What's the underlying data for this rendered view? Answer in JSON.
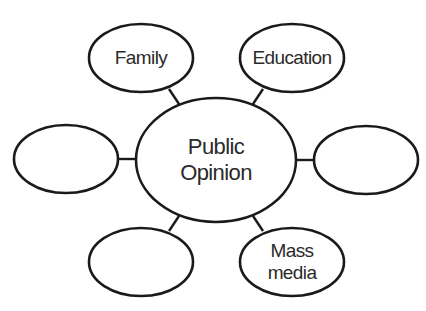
{
  "diagram": {
    "type": "concept-web",
    "center": {
      "id": "public-opinion",
      "lines": [
        "Public",
        "Opinion"
      ],
      "cx": 216,
      "cy": 160,
      "rx": 80,
      "ry": 62
    },
    "nodes": [
      {
        "id": "family",
        "lines": [
          "Family"
        ],
        "cx": 141,
        "cy": 58,
        "rx": 52,
        "ry": 34,
        "connector": {
          "x1": 169,
          "y1": 89,
          "x2": 179,
          "y2": 104
        }
      },
      {
        "id": "education",
        "lines": [
          "Education"
        ],
        "cx": 292,
        "cy": 58,
        "rx": 52,
        "ry": 34,
        "connector": {
          "x1": 263,
          "y1": 89,
          "x2": 253,
          "y2": 104
        }
      },
      {
        "id": "left-blank",
        "lines": [],
        "cx": 66,
        "cy": 159,
        "rx": 52,
        "ry": 34,
        "connector": {
          "x1": 118,
          "y1": 159,
          "x2": 136,
          "y2": 159
        }
      },
      {
        "id": "right-blank",
        "lines": [],
        "cx": 366,
        "cy": 160,
        "rx": 52,
        "ry": 34,
        "connector": {
          "x1": 296,
          "y1": 160,
          "x2": 314,
          "y2": 160
        }
      },
      {
        "id": "bottom-left-blank",
        "lines": [],
        "cx": 141,
        "cy": 262,
        "rx": 52,
        "ry": 34,
        "connector": {
          "x1": 179,
          "y1": 216,
          "x2": 169,
          "y2": 231
        }
      },
      {
        "id": "mass-media",
        "lines": [
          "Mass",
          "media"
        ],
        "cx": 292,
        "cy": 262,
        "rx": 52,
        "ry": 34,
        "connector": {
          "x1": 253,
          "y1": 216,
          "x2": 263,
          "y2": 231
        }
      }
    ],
    "colors": {
      "stroke": "#1a1a1a",
      "text": "#2a2a2a",
      "background": "#ffffff"
    }
  }
}
